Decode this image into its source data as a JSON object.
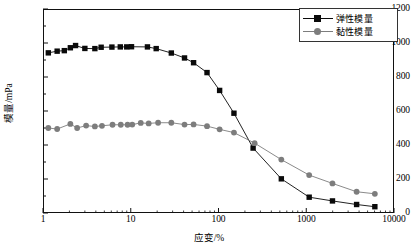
{
  "chart_data": {
    "type": "line",
    "title": "",
    "xlabel": "应变/%",
    "ylabel": "模量/mPa",
    "xscale": "log",
    "xlim": [
      1,
      10000
    ],
    "ylim": [
      0,
      1200
    ],
    "xticks": [
      1,
      10,
      100,
      1000,
      10000
    ],
    "xtick_labels": [
      "1",
      "10",
      "100",
      "1000",
      "10000"
    ],
    "yticks": [
      0,
      200,
      400,
      600,
      800,
      1000,
      1200
    ],
    "ytick_labels": [
      "0",
      "200",
      "400",
      "600",
      "800",
      "1000",
      "1200"
    ],
    "grid": false,
    "legend_position": "top-right",
    "series": [
      {
        "name": "弹性模量",
        "marker": "square",
        "color": "#0a0a0a",
        "points": [
          [
            1.15,
            942
          ],
          [
            1.45,
            952
          ],
          [
            1.75,
            955
          ],
          [
            2.05,
            972
          ],
          [
            2.35,
            985
          ],
          [
            3.0,
            968
          ],
          [
            3.9,
            967
          ],
          [
            4.6,
            975
          ],
          [
            6.1,
            976
          ],
          [
            7.6,
            977
          ],
          [
            9.0,
            977
          ],
          [
            10.2,
            978
          ],
          [
            15.5,
            977
          ],
          [
            19.5,
            967
          ],
          [
            29.0,
            941
          ],
          [
            41.0,
            912
          ],
          [
            52.0,
            884
          ],
          [
            74.0,
            826
          ],
          [
            103.0,
            721
          ],
          [
            150.0,
            587
          ],
          [
            248.0,
            382
          ],
          [
            520.0,
            201
          ],
          [
            1080.0,
            93
          ],
          [
            1990.0,
            71
          ],
          [
            3750.0,
            50
          ],
          [
            6050.0,
            37
          ]
        ]
      },
      {
        "name": "黏性模量",
        "marker": "circle",
        "color": "#7d7d7d",
        "points": [
          [
            1.15,
            500
          ],
          [
            1.45,
            494
          ],
          [
            2.05,
            524
          ],
          [
            2.45,
            500
          ],
          [
            3.1,
            514
          ],
          [
            3.9,
            509
          ],
          [
            4.7,
            513
          ],
          [
            6.2,
            519
          ],
          [
            7.7,
            519
          ],
          [
            9.2,
            519
          ],
          [
            10.4,
            520
          ],
          [
            13.0,
            530
          ],
          [
            16.0,
            527
          ],
          [
            20.5,
            531
          ],
          [
            29.0,
            531
          ],
          [
            41.0,
            520
          ],
          [
            52.0,
            521
          ],
          [
            74.0,
            511
          ],
          [
            103.0,
            492
          ],
          [
            150.0,
            473
          ],
          [
            258.0,
            411
          ],
          [
            520.0,
            314
          ],
          [
            1080.0,
            223
          ],
          [
            1990.0,
            174
          ],
          [
            3750.0,
            125
          ],
          [
            6050.0,
            113
          ]
        ]
      }
    ]
  },
  "legend": {
    "items": [
      {
        "label": "弹性模量",
        "marker": "square",
        "color": "#0a0a0a"
      },
      {
        "label": "黏性模量",
        "marker": "circle",
        "color": "#7d7d7d"
      }
    ]
  }
}
